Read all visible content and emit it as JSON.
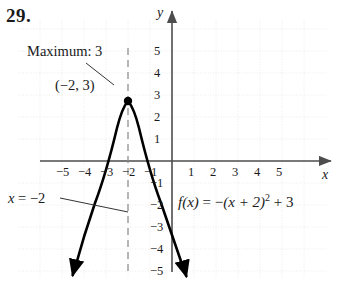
{
  "problem": {
    "number": "29."
  },
  "chart_data": {
    "type": "line",
    "title": "",
    "function_label": "f(x) = −(x + 2)² + 3",
    "function_parts": {
      "name": "f",
      "arg": "(x)",
      "eq": "=",
      "rhs_sign": "−",
      "rhs_body": "(x + 2)",
      "power": "2",
      "plus": "+",
      "constant": "3"
    },
    "xlabel": "x",
    "ylabel": "y",
    "xlim": [
      -6.6,
      6.9
    ],
    "ylim": [
      -6.3,
      6.6
    ],
    "grid": true,
    "x_ticks": [
      -5,
      -4,
      -3,
      -2,
      -1,
      1,
      2,
      3,
      4,
      5
    ],
    "y_ticks": [
      5,
      4,
      3,
      2,
      1,
      -1,
      -2,
      -3,
      -4,
      -5
    ],
    "x_tick_labels": [
      "−5",
      "−4",
      "−3",
      "−2",
      "−1",
      "1",
      "2",
      "3",
      "4",
      "5"
    ],
    "y_tick_labels": [
      "5",
      "4",
      "3",
      "2",
      "1",
      "−1",
      "−2",
      "−3",
      "−4",
      "−5"
    ],
    "vertex": {
      "x": -2,
      "y": 3,
      "label": "(−2, 3)"
    },
    "annotations": [
      {
        "name": "maximum",
        "text": "Maximum: 3"
      },
      {
        "name": "axis-of-symmetry",
        "text": "x = −2",
        "text_parts": {
          "var": "x",
          "eq": "=",
          "value": "−2"
        }
      }
    ],
    "axis_of_symmetry": {
      "equation": "x = -2",
      "x": -2,
      "style": "dashed"
    },
    "curve": {
      "name": "parabola",
      "equation": "y = -(x+2)^2 + 3",
      "direction": "opens-downward",
      "arrows": [
        "left-end",
        "right-end"
      ],
      "points": [
        {
          "x": -4.8,
          "y": -4.84
        },
        {
          "x": -4.4,
          "y": -2.76
        },
        {
          "x": -4.0,
          "y": -1.0
        },
        {
          "x": -3.5,
          "y": 0.75
        },
        {
          "x": -3.0,
          "y": 2.0
        },
        {
          "x": -2.5,
          "y": 2.75
        },
        {
          "x": -2.0,
          "y": 3.0
        },
        {
          "x": -1.5,
          "y": 2.75
        },
        {
          "x": -1.0,
          "y": 2.0
        },
        {
          "x": -0.5,
          "y": 0.75
        },
        {
          "x": 0.0,
          "y": -1.0
        },
        {
          "x": 0.4,
          "y": -2.76
        },
        {
          "x": 0.8,
          "y": -4.84
        }
      ]
    },
    "colors": {
      "axis": "#4d4d4d",
      "curve": "#000000",
      "grid": "#e8e8e8",
      "text": "#1a1a1a",
      "dashed": "#808080"
    }
  }
}
